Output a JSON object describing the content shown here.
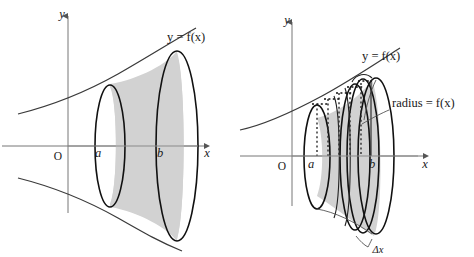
{
  "figure": {
    "background_color": "#ffffff",
    "stroke_color": "#111111",
    "axis_color": "#777777",
    "fill_light": "#e3e3e3",
    "fill_mid": "#d2d2d2",
    "fill_dark": "#bfbfbf"
  },
  "panels": [
    {
      "id": "left",
      "name": "solid-of-revolution",
      "axes": {
        "x_label": "x",
        "y_label": "y",
        "origin_label": "O"
      },
      "curve_label": "y = f(x)",
      "bound_labels": {
        "lower": "a",
        "upper": "b"
      }
    },
    {
      "id": "right",
      "name": "disk-approximation",
      "axes": {
        "x_label": "x",
        "y_label": "y",
        "origin_label": "O"
      },
      "curve_label": "y = f(x)",
      "radius_label": "radius = f(x)",
      "thickness_label": "Δx",
      "bound_labels": {
        "lower": "a",
        "upper": "b"
      }
    }
  ]
}
